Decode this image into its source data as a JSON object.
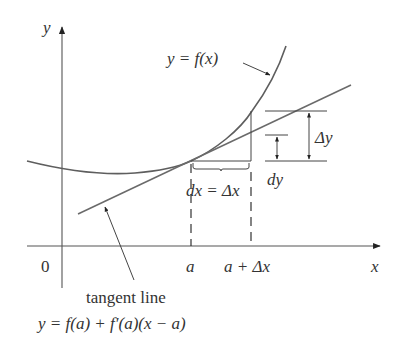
{
  "diagram": {
    "axes": {
      "y_label": "y",
      "x_label": "x",
      "origin_label": "0"
    },
    "curve_label": "y = f(x)",
    "tick_labels": {
      "a": "a",
      "a_plus_dx": "a + Δx"
    },
    "dx_label": "dx = Δx",
    "delta_y_label": "Δy",
    "dy_label": "dy",
    "tangent_label": "tangent line",
    "tangent_equation": "y = f(a) + f′(a)(x − a)",
    "colors": {
      "curve": "#5e5e5e",
      "tangent": "#6a6a6a",
      "axes": "#555555",
      "text": "#333333"
    }
  }
}
